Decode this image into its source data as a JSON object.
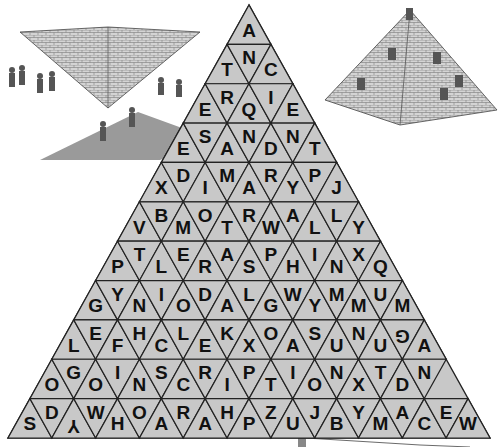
{
  "puzzle": {
    "title": "Pyramid word search",
    "fill_color": "#c8c8c8",
    "line_color": "#222222",
    "text_color": "#111111",
    "rows": [
      [
        "A"
      ],
      [
        "T",
        "N",
        "C"
      ],
      [
        "E",
        "R",
        "Q",
        "I",
        "E"
      ],
      [
        "E",
        "S",
        "A",
        "N",
        "D",
        "N",
        "T"
      ],
      [
        "X",
        "D",
        "I",
        "M",
        "A",
        "R",
        "Y",
        "P",
        "J"
      ],
      [
        "V",
        "B",
        "M",
        "O",
        "T",
        "R",
        "W",
        "A",
        "L",
        "L",
        "Y"
      ],
      [
        "P",
        "T",
        "L",
        "E",
        "R",
        "A",
        "S",
        "P",
        "H",
        "I",
        "N",
        "X",
        "Q"
      ],
      [
        "G",
        "Y",
        "N",
        "I",
        "O",
        "D",
        "A",
        "L",
        "G",
        "W",
        "Y",
        "M",
        "M",
        "U",
        "M"
      ],
      [
        "L",
        "E",
        "F",
        "H",
        "C",
        "L",
        "E",
        "K",
        "X",
        "O",
        "A",
        "S",
        "U",
        "N",
        "U",
        "G",
        "A"
      ],
      [
        "O",
        "G",
        "O",
        "I",
        "N",
        "S",
        "C",
        "R",
        "I",
        "P",
        "T",
        "I",
        "O",
        "N",
        "X",
        "T",
        "D",
        "N"
      ]
    ],
    "bottom_row": [
      "S",
      "D",
      "Y",
      "W",
      "H",
      "O",
      "A",
      "R",
      "A",
      "H",
      "P",
      "Z",
      "U",
      "J",
      "B",
      "Y",
      "M",
      "A",
      "C",
      "E",
      "W"
    ],
    "rotated_cells": {
      "8-15": 180,
      "10-2": 180
    }
  },
  "illustrations": {
    "left": "inverted-pyramid-with-workers",
    "right": "pyramid-with-climbers"
  }
}
